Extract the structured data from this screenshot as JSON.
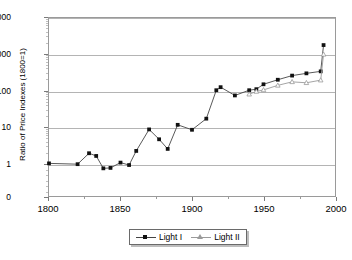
{
  "chart_data": {
    "type": "line",
    "title": "",
    "xlabel": "",
    "ylabel": "Ratio of Price Indexes (1800=1)",
    "yscale": "log",
    "ylim": [
      1,
      10000
    ],
    "xlim": [
      1800,
      2000
    ],
    "grid": true,
    "legend_position": "bottom",
    "ytick_labels": [
      "10000",
      "1000",
      "100",
      "10",
      "1",
      "0"
    ],
    "ytick_values": [
      10000,
      1000,
      100,
      10,
      1,
      0
    ],
    "xtick_labels": [
      "1800",
      "1850",
      "1900",
      "1950",
      "2000"
    ],
    "xtick_values": [
      1800,
      1850,
      1900,
      1950,
      2000
    ],
    "xminor_values": [
      1825,
      1875,
      1925,
      1975
    ],
    "series": [
      {
        "name": "Light I",
        "marker": "filled-square",
        "color": "#111111",
        "line_color": "#444444",
        "x": [
          1800,
          1820,
          1828,
          1833,
          1838,
          1843,
          1850,
          1856,
          1861,
          1870,
          1877,
          1883,
          1890,
          1900,
          1910,
          1917,
          1920,
          1930,
          1940,
          1945,
          1950,
          1960,
          1970,
          1980,
          1990,
          1992
        ],
        "y": [
          1.0,
          0.95,
          1.9,
          1.6,
          0.73,
          0.75,
          1.05,
          0.9,
          2.2,
          8.6,
          4.6,
          2.5,
          11.5,
          8.4,
          17,
          103,
          125,
          74,
          103,
          110,
          150,
          200,
          260,
          300,
          340,
          1800
        ]
      },
      {
        "name": "Light II",
        "marker": "open-triangle",
        "color": "#9a9a9a",
        "line_color": "#9a9a9a",
        "x": [
          1940,
          1945,
          1950,
          1960,
          1970,
          1980,
          1990,
          1992
        ],
        "y": [
          80,
          95,
          105,
          140,
          175,
          165,
          195,
          1000
        ]
      }
    ]
  },
  "legend": {
    "items": [
      {
        "label": "Light I",
        "marker": "filled-square"
      },
      {
        "label": "Light II",
        "marker": "open-triangle"
      }
    ]
  }
}
